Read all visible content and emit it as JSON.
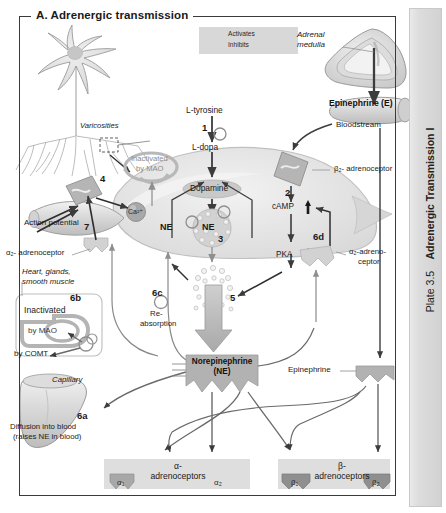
{
  "plate": {
    "number": "Plate 3.5",
    "title": "Adrenergic Transmission I"
  },
  "panel": {
    "letter": "A.",
    "title": "A.  Adrenergic transmission"
  },
  "legend": {
    "activates": "Activates",
    "inhibits": "Inhibits",
    "activates_icon": "arrow-right-icon",
    "inhibits_icon": "arrow-tee-icon"
  },
  "labels": {
    "varicosities": "Varicosities",
    "adrenal_medulla": "Adrenal\nmedulla",
    "adrenal_medulla_l1": "Adrenal",
    "adrenal_medulla_l2": "medulla",
    "epinephrine_e": "Epinephrine (E)",
    "bloodstream": "Bloodstream",
    "l_tyrosine": "L-tyrosine",
    "l_dopa": "L-dopa",
    "dopamine": "Dopamine",
    "ne": "NE",
    "ne_vesicle": "NE",
    "inactivated_by_mao": "Inactivated\nby MAO",
    "inactivated_by_mao_l1": "Inactivated",
    "inactivated_by_mao_l2": "by MAO",
    "camp": "cAMP",
    "pka": "PKA",
    "beta2_adrenoceptor": "β₂- adrenoceptor",
    "alpha2_adrenoceptor_right_l1": "α₂-adreno-",
    "alpha2_adrenoceptor_right_l2": "ceptor",
    "alpha2_adrenoceptor_left": "α₂- adrenoceptor",
    "action_potential": "Action potential",
    "calcium": "Ca²⁺",
    "heart_glands_l1": "Heart, glands,",
    "heart_glands_l2": "smooth muscle",
    "inactivated": "Inactivated",
    "by_mao": "by MAO",
    "by_comt": "by COMT",
    "reabsorption_l1": "Re-",
    "reabsorption_l2": "absorption",
    "capillary": "Capillary",
    "diffusion_l1": "Diffusion into blood",
    "diffusion_l2": "(raises NE in blood)",
    "norepinephrine_l1": "Norepinephrine",
    "norepinephrine_l2": "(NE)",
    "epinephrine": "Epinephrine",
    "alpha_adrenoceptors_l1": "α-",
    "alpha_adrenoceptors_l2": "adrenoceptors",
    "beta_adrenoceptors_l1": "β-",
    "beta_adrenoceptors_l2": "adrenoceptors",
    "alpha1": "α₁",
    "alpha2_bottom": "α₂",
    "beta1": "β₁",
    "beta2": "β₂"
  },
  "steps": {
    "s1": "1",
    "s2": "2",
    "s3": "3",
    "s4": "4",
    "s5": "5",
    "s6a": "6a",
    "s6b": "6b",
    "s6c": "6c",
    "s6d": "6d",
    "s7": "7"
  },
  "colors": {
    "page_bg": "#ffffff",
    "frame_stroke": "#3a3a3a",
    "legend_bg": "#d8d8d8",
    "cell_fill": "#ebebeb",
    "cell_stroke": "#c4c4c4",
    "neuron_fill": "#e2e2e2",
    "receptor_fill": "#b9b9b9",
    "vesicle_fill": "#d6d6d6",
    "arrow_dark": "#3c3c3c",
    "arrow_gray": "#9a9a9a",
    "band_bg": "#e0e0e0",
    "ne_badge": "#b0b0b0",
    "plate_tab": "#dcdcdc",
    "text": "#1a1a1a"
  }
}
